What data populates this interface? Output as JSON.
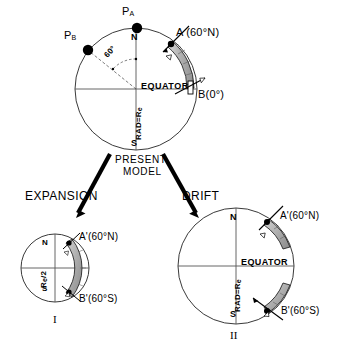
{
  "figure": {
    "title_text": "PRESENT MODEL",
    "type": "geophysical-diagram"
  },
  "present_model": {
    "label_line1": "PRESENT",
    "label_line2": "MODEL",
    "north_label": "N",
    "south_label": "S",
    "equator_label": "EQUATOR",
    "radius_label": "RAD=R",
    "radius_label_sub": "e",
    "angle_label": "60°",
    "pole_a_label": "P",
    "pole_a_sub": "A",
    "pole_b_label": "P",
    "pole_b_sub": "B",
    "site_a_label": "A (60°N)",
    "site_b_label": "B(0°)"
  },
  "branches": {
    "left_label": "EXPANSION",
    "right_label": "DRIFT"
  },
  "expansion_model": {
    "numeral": "I",
    "north_label": "N",
    "south_label": "S",
    "radius_label": "R",
    "radius_label_sub": "e",
    "radius_label_tail": "/2",
    "site_a_label": "A'(60°N)",
    "site_b_label": "B'(60°S)"
  },
  "drift_model": {
    "numeral": "II",
    "north_label": "N",
    "south_label": "S",
    "equator_label": "EQUATOR",
    "radius_label": "RAD=R",
    "radius_label_sub": "e",
    "site_a_label": "A'(60°N)",
    "site_b_label": "B'(60°S)"
  },
  "colors": {
    "line": "#000000",
    "circle_stroke": "#3a3a3a",
    "band_fill": "#a8a8a8",
    "band_stroke": "#000000",
    "background": "#ffffff"
  }
}
